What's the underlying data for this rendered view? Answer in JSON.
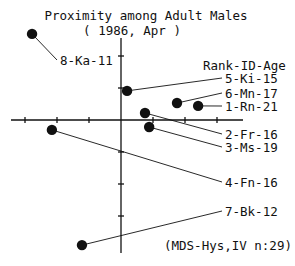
{
  "chart_data": {
    "type": "scatter",
    "title": "Proximity among Adult Males",
    "subtitle": "( 1986, Apr )",
    "legend_header": "Rank-ID-Age",
    "footnote": "(MDS-Hys,IV  n:29)",
    "xlabel": "",
    "ylabel": "",
    "xlim": [
      -3.4,
      3.8
    ],
    "ylim": [
      -4.2,
      2.6
    ],
    "grid": false,
    "axes_through_origin": true,
    "x_ticks": [
      -3,
      -2,
      -1,
      1,
      2,
      3
    ],
    "y_ticks": [
      -3,
      -2,
      -1,
      1,
      2
    ],
    "points": [
      {
        "label": "8-Ka-11",
        "rank": 8,
        "id": "Ka",
        "age": 11,
        "x": -2.78,
        "y": 2.69
      },
      {
        "label": "5-Ki-15",
        "rank": 5,
        "id": "Ki",
        "age": 15,
        "x": 0.19,
        "y": 0.91
      },
      {
        "label": "6-Mn-17",
        "rank": 6,
        "id": "Mn",
        "age": 17,
        "x": 1.75,
        "y": 0.53
      },
      {
        "label": "1-Rn-21",
        "rank": 1,
        "id": "Rn",
        "age": 21,
        "x": 2.41,
        "y": 0.44
      },
      {
        "label": "2-Fr-16",
        "rank": 2,
        "id": "Fr",
        "age": 16,
        "x": 0.75,
        "y": 0.22
      },
      {
        "label": "3-Ms-19",
        "rank": 3,
        "id": "Ms",
        "age": 19,
        "x": 0.88,
        "y": -0.22
      },
      {
        "label": "4-Fn-16",
        "rank": 4,
        "id": "Fn",
        "age": 16,
        "x": -2.16,
        "y": -0.31
      },
      {
        "label": "7-Bk-12",
        "rank": 7,
        "id": "Bk",
        "age": 12,
        "x": -1.22,
        "y": -3.91
      }
    ]
  },
  "layout": {
    "origin_px": [
      121,
      120
    ],
    "unit_px": 32,
    "label_positions_px": {
      "8-Ka-11": [
        60,
        60
      ],
      "5-Ki-15": [
        225,
        78
      ],
      "6-Mn-17": [
        225,
        93
      ],
      "1-Rn-21": [
        225,
        106
      ],
      "2-Fr-16": [
        225,
        134
      ],
      "3-Ms-19": [
        225,
        147
      ],
      "4-Fn-16": [
        225,
        182
      ],
      "7-Bk-12": [
        225,
        211
      ]
    },
    "colors": {
      "ink": "#111111",
      "background": "#ffffff"
    }
  }
}
